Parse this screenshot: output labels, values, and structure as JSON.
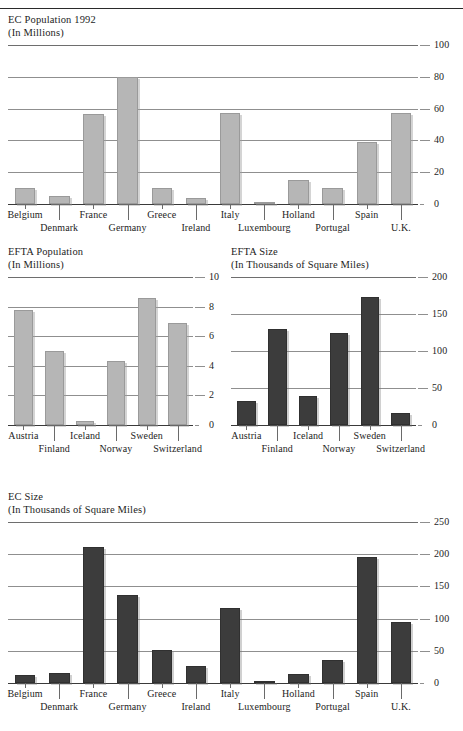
{
  "page": {
    "has_top_rule": true,
    "bar_color_light": "#b6b6b6",
    "bar_color_dark": "#3c3c3c",
    "grid_color": "#8f8f8f"
  },
  "chart_data": [
    {
      "id": "ec-population",
      "type": "bar",
      "title": "EC Population 1992",
      "subtitle": "(In Millions)",
      "xlabel": "",
      "ylabel": "",
      "ylim": [
        0,
        100
      ],
      "yticks": [
        0,
        20,
        40,
        60,
        80,
        100
      ],
      "ytick_labels": [
        "0",
        "20",
        "40",
        "60",
        "80",
        "100"
      ],
      "grid": true,
      "legend": "none",
      "bar_color": "#b6b6b6",
      "categories": [
        "Belgium",
        "Denmark",
        "France",
        "Germany",
        "Greece",
        "Ireland",
        "Italy",
        "Luxembourg",
        "Holland",
        "Portugal",
        "Spain",
        "U.K."
      ],
      "values": [
        10,
        5,
        56.5,
        80,
        10,
        3.5,
        57,
        0.4,
        15,
        10,
        39,
        57
      ]
    },
    {
      "id": "efta-population",
      "type": "bar",
      "title": "EFTA Population",
      "subtitle": "(In Millions)",
      "xlabel": "",
      "ylabel": "",
      "ylim": [
        0,
        10
      ],
      "yticks": [
        0,
        2,
        4,
        6,
        8,
        10
      ],
      "ytick_labels": [
        "0",
        "2",
        "4",
        "6",
        "8",
        "10"
      ],
      "grid": true,
      "legend": "none",
      "bar_color": "#b6b6b6",
      "categories": [
        "Austria",
        "Finland",
        "Iceland",
        "Norway",
        "Sweden",
        "Switzerland"
      ],
      "values": [
        7.8,
        5.0,
        0.3,
        4.3,
        8.6,
        6.9
      ]
    },
    {
      "id": "efta-size",
      "type": "bar",
      "title": "EFTA Size",
      "subtitle": "(In Thousands of Square Miles)",
      "xlabel": "",
      "ylabel": "",
      "ylim": [
        0,
        200
      ],
      "yticks": [
        0,
        50,
        100,
        150,
        200
      ],
      "ytick_labels": [
        "0",
        "50",
        "100",
        "150",
        "200"
      ],
      "grid": true,
      "legend": "none",
      "bar_color": "#3c3c3c",
      "categories": [
        "Austria",
        "Finland",
        "Iceland",
        "Norway",
        "Sweden",
        "Switzerland"
      ],
      "values": [
        32,
        130,
        39,
        125,
        173,
        16
      ]
    },
    {
      "id": "ec-size",
      "type": "bar",
      "title": "EC Size",
      "subtitle": "(In Thousands of Square Miles)",
      "xlabel": "",
      "ylabel": "",
      "ylim": [
        0,
        250
      ],
      "yticks": [
        0,
        50,
        100,
        150,
        200,
        250
      ],
      "ytick_labels": [
        "0",
        "50",
        "100",
        "150",
        "200",
        "250"
      ],
      "grid": true,
      "legend": "none",
      "bar_color": "#3c3c3c",
      "categories": [
        "Belgium",
        "Denmark",
        "France",
        "Germany",
        "Greece",
        "Ireland",
        "Italy",
        "Luxembourg",
        "Holland",
        "Portugal",
        "Spain",
        "U.K."
      ],
      "values": [
        12,
        16,
        211,
        137,
        51,
        27,
        116,
        1,
        14,
        36,
        195,
        94
      ]
    }
  ]
}
